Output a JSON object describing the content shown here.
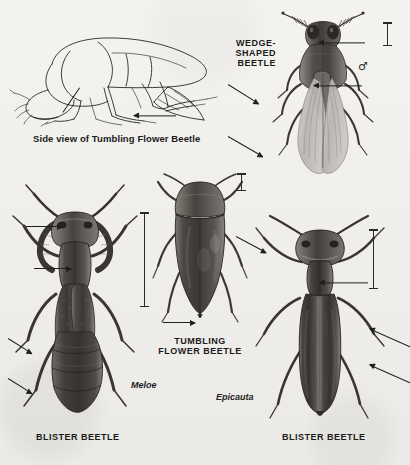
{
  "plate": {
    "medium": "halftone-scan",
    "background_color": "#f1f0ed",
    "ink_color": "#1c1c1c"
  },
  "figures": [
    {
      "id": "side-view-tumbling-flower-beetle",
      "style": "line-drawing",
      "caption": "Side view of Tumbling Flower Beetle",
      "caption_case": "sentence",
      "has_scale_bar": false,
      "pointer_count": 2
    },
    {
      "id": "wedge-shaped-beetle",
      "style": "halftone",
      "caption": "WEDGE-\nSHAPED\nBEETLE",
      "caption_case": "caps",
      "sex_symbol": "♂",
      "has_scale_bar": true,
      "pointer_count": 4
    },
    {
      "id": "tumbling-flower-beetle",
      "style": "halftone",
      "caption": "TUMBLING\nFLOWER BEETLE",
      "caption_case": "caps",
      "has_scale_bar": true,
      "pointer_count": 1
    },
    {
      "id": "blister-beetle-meloe",
      "style": "halftone",
      "caption": "BLISTER BEETLE",
      "caption_case": "caps",
      "genus": "Meloe",
      "has_scale_bar": true,
      "pointer_count": 4
    },
    {
      "id": "blister-beetle-epicauta",
      "style": "halftone",
      "caption": "BLISTER BEETLE",
      "caption_case": "caps",
      "genus": "Epicauta",
      "has_scale_bar": true,
      "pointer_count": 4
    }
  ],
  "labels": {
    "side_view": "Side view of Tumbling Flower Beetle",
    "wedge_shaped": "WEDGE-\nSHAPED\nBEETLE",
    "tumbling_flower": "TUMBLING\nFLOWER BEETLE",
    "blister_left": "BLISTER BEETLE",
    "blister_right": "BLISTER BEETLE",
    "genus_meloe": "Meloe",
    "genus_epicauta": "Epicauta",
    "male_symbol": "♂"
  }
}
